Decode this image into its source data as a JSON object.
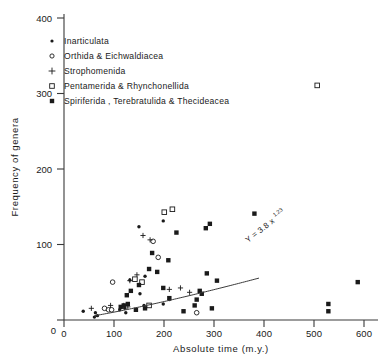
{
  "chart_data": {
    "type": "scatter",
    "title": "",
    "xlabel": "Absolute time (m.y.)",
    "ylabel": "Frequency of genera",
    "xlim": [
      0,
      620
    ],
    "ylim": [
      0,
      420
    ],
    "xticks": [
      0,
      100,
      200,
      300,
      400,
      500,
      600
    ],
    "yticks": [
      0,
      100,
      200,
      300,
      400
    ],
    "xtick_labels": [
      "0",
      "100",
      "200",
      "300",
      "400",
      "500",
      "600"
    ],
    "ytick_labels": [
      "0",
      "100",
      "200",
      "300",
      "400"
    ],
    "grid": false,
    "legend_position": "upper-left-inside",
    "annotations": [
      {
        "name": "regression-equation",
        "text_base": "Y = 3.8 x",
        "text_exponent": "1.23",
        "rotation_deg": -38
      }
    ],
    "fit_curve": {
      "label": "power-law fit",
      "coefficient": 3.8,
      "exponent": 1.23,
      "x_start": 60,
      "x_end": 385
    },
    "series": [
      {
        "name": "Inarticulata",
        "marker": "dot",
        "points": [
          [
            38,
            12
          ],
          [
            62,
            10
          ],
          [
            60,
            4
          ],
          [
            66,
            6
          ],
          [
            110,
            14
          ],
          [
            120,
            16
          ],
          [
            122,
            10
          ],
          [
            158,
            20
          ],
          [
            196,
            22
          ],
          [
            130,
            55
          ],
          [
            148,
            128
          ],
          [
            160,
            60
          ],
          [
            196,
            136
          ],
          [
            208,
            28
          ],
          [
            150,
            36
          ]
        ]
      },
      {
        "name": "Orthida & Eichwaldiacea",
        "marker": "open-circle",
        "points": [
          [
            80,
            16
          ],
          [
            88,
            14
          ],
          [
            94,
            14
          ],
          [
            96,
            52
          ],
          [
            186,
            86
          ],
          [
            176,
            108
          ],
          [
            262,
            10
          ]
        ]
      },
      {
        "name": "Strophomenida",
        "marker": "plus",
        "points": [
          [
            54,
            16
          ],
          [
            92,
            20
          ],
          [
            118,
            20
          ],
          [
            126,
            18
          ],
          [
            130,
            54
          ],
          [
            144,
            62
          ],
          [
            156,
            116
          ],
          [
            170,
            110
          ],
          [
            208,
            42
          ],
          [
            248,
            38
          ],
          [
            230,
            44
          ]
        ]
      },
      {
        "name": "Pentamerida & Rhynchonellida",
        "marker": "open-square",
        "points": [
          [
            140,
            56
          ],
          [
            154,
            52
          ],
          [
            168,
            20
          ],
          [
            198,
            148
          ],
          [
            214,
            152
          ],
          [
            500,
            322
          ]
        ]
      },
      {
        "name": "Spiriferida, Terebratulida & Thecideacea",
        "marker": "filled-square",
        "points": [
          [
            112,
            18
          ],
          [
            118,
            20
          ],
          [
            126,
            22
          ],
          [
            124,
            34
          ],
          [
            132,
            40
          ],
          [
            142,
            14
          ],
          [
            148,
            48
          ],
          [
            160,
            16
          ],
          [
            168,
            70
          ],
          [
            174,
            92
          ],
          [
            184,
            66
          ],
          [
            196,
            44
          ],
          [
            206,
            82
          ],
          [
            208,
            30
          ],
          [
            222,
            120
          ],
          [
            236,
            12
          ],
          [
            258,
            20
          ],
          [
            262,
            28
          ],
          [
            268,
            40
          ],
          [
            272,
            36
          ],
          [
            280,
            126
          ],
          [
            288,
            132
          ],
          [
            282,
            64
          ],
          [
            292,
            16
          ],
          [
            302,
            54
          ],
          [
            376,
            146
          ],
          [
            522,
            22
          ],
          [
            522,
            12
          ],
          [
            580,
            52
          ]
        ]
      }
    ]
  },
  "legend": {
    "items": [
      {
        "marker": "dot",
        "label": "Inarticulata"
      },
      {
        "marker": "open-circle",
        "label": "Orthida & Eichwaldiacea"
      },
      {
        "marker": "plus",
        "label": "Strophomenida"
      },
      {
        "marker": "open-square",
        "label": "Pentamerida & Rhynchonellida"
      },
      {
        "marker": "filled-square",
        "label": "Spiriferida , Terebratulida & Thecideacea"
      }
    ]
  },
  "colors": {
    "ink": "#1a1a1a",
    "axis": "#3a3a3a",
    "background": "#ffffff"
  }
}
